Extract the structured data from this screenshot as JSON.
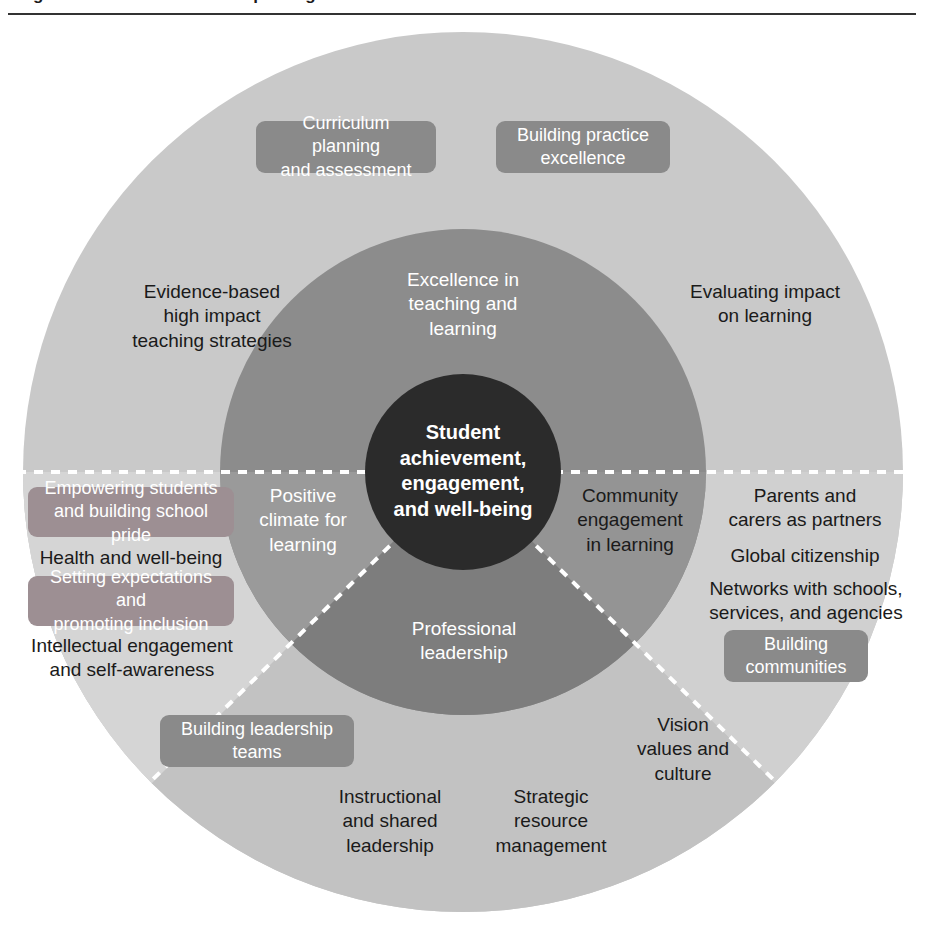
{
  "header": {
    "clipped_heading": "Figure: The framework for improving student outcomes",
    "rule_color": "#333333"
  },
  "colors": {
    "outer_ring_top": "#c9c9c9",
    "outer_ring_left": "#d5d5d5",
    "outer_ring_bottom": "#c2c2c2",
    "outer_ring_right": "#d0d0d0",
    "inner_ring_top": "#8c8c8c",
    "inner_ring_left": "#9a9a9a",
    "inner_ring_bottom": "#7d7d7d",
    "inner_ring_right": "#949494",
    "core_circle": "#2b2b2b",
    "pill_grey": "#8a8a8a",
    "pill_mauve": "#9d8f93",
    "divider_dash": "#ffffff",
    "page_background": "#ffffff"
  },
  "center": {
    "label": "Student\nachievement,\nengagement,\nand well-being"
  },
  "inner_ring": {
    "top": "Excellence in\nteaching and\nlearning",
    "left": "Positive\nclimate for\nlearning",
    "right": "Community\nengagement\nin learning",
    "bottom": "Professional\nleadership"
  },
  "quadrants": {
    "excellence_in_teaching_and_learning": {
      "pills": [
        "Curriculum planning\nand assessment",
        "Building practice\nexcellence"
      ],
      "texts": [
        "Evidence-based\nhigh impact\nteaching strategies",
        "Evaluating impact\non learning"
      ]
    },
    "positive_climate_for_learning": {
      "pills": [
        "Empowering students\nand building school pride",
        "Setting expectations and\npromoting inclusion"
      ],
      "texts": [
        "Health and well-being",
        "Intellectual engagement\nand self-awareness"
      ]
    },
    "community_engagement_in_learning": {
      "pills": [
        "Building\ncommunities"
      ],
      "texts": [
        "Parents and\ncarers as partners",
        "Global citizenship",
        "Networks with schools,\nservices, and agencies"
      ]
    },
    "professional_leadership": {
      "pills": [
        "Building leadership\nteams"
      ],
      "texts": [
        "Vision\nvalues and\nculture",
        "Instructional\nand shared\nleadership",
        "Strategic\nresource\nmanagement"
      ]
    }
  }
}
